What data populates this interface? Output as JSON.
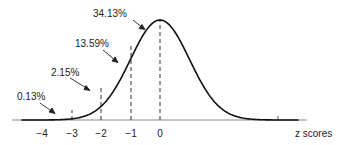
{
  "chart_data": {
    "type": "line",
    "title": "",
    "xlabel": "z scores",
    "ylabel": "",
    "x_ticks": [
      "-4",
      "-3",
      "-2",
      "-1",
      "0"
    ],
    "x_tick_values": [
      -4,
      -3,
      -2,
      -1,
      0
    ],
    "xlim": [
      -4.8,
      4.8
    ],
    "grid": false,
    "curve": "standard normal distribution",
    "annotations": [
      {
        "text": "0.13%",
        "region": "below -3"
      },
      {
        "text": "2.15%",
        "region": "-3 to -2"
      },
      {
        "text": "13.59%",
        "region": "-2 to -1"
      },
      {
        "text": "34.13%",
        "region": "-1 to 0"
      }
    ],
    "dashed_lines_at": [
      -3,
      -2,
      -1,
      0
    ]
  },
  "labels": {
    "ann0": "0.13%",
    "ann1": "2.15%",
    "ann2": "13.59%",
    "ann3": "34.13%",
    "t0": "−4",
    "t1": "−3",
    "t2": "−2",
    "t3": "−1",
    "t4": "0",
    "xlabel": "z scores"
  }
}
